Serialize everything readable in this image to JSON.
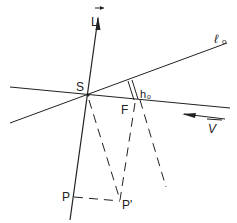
{
  "diagram": {
    "labels": {
      "L": "L",
      "l0": "ℓ",
      "l0_sub": "o",
      "S": "S",
      "F": "F",
      "h0": "h",
      "h0_sub": "o",
      "V": "V",
      "P": "P",
      "P_prime": "P'"
    },
    "colors": {
      "stroke": "#222222",
      "background": "#ffffff"
    }
  }
}
